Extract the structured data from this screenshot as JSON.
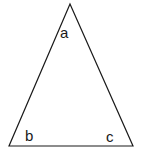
{
  "diagram": {
    "type": "triangle",
    "stroke_color": "#1a1a1a",
    "background": "#ffffff",
    "vertices": {
      "apex": {
        "x": 70,
        "y": 4
      },
      "bottom_left": {
        "x": 9,
        "y": 146
      },
      "bottom_right": {
        "x": 133,
        "y": 146
      }
    },
    "labels": {
      "a": "a",
      "b": "b",
      "c": "c"
    }
  }
}
